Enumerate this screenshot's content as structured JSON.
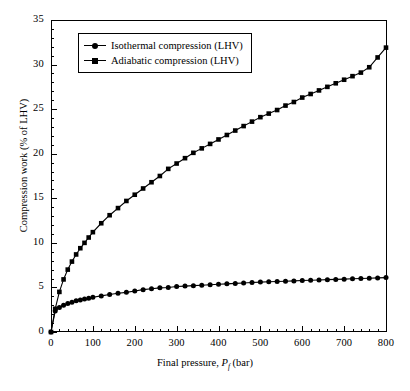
{
  "figure": {
    "background": "#ffffff",
    "foreground": "#000000"
  },
  "chart_data": {
    "type": "line",
    "title": "",
    "xlabel": "Final pressure, P_f (bar)",
    "ylabel": "Compression work (% of LHV)",
    "xlim": [
      0,
      800
    ],
    "ylim": [
      0,
      35
    ],
    "xticks": [
      0,
      100,
      200,
      300,
      400,
      500,
      600,
      700,
      800
    ],
    "yticks": [
      0,
      5,
      10,
      15,
      20,
      25,
      30,
      35
    ],
    "x_minor_interval": 20,
    "y_minor_interval": 1,
    "grid": false,
    "legend_position": "upper left",
    "x": [
      0,
      10,
      20,
      30,
      40,
      50,
      60,
      70,
      80,
      90,
      100,
      120,
      140,
      160,
      180,
      200,
      220,
      240,
      260,
      280,
      300,
      320,
      340,
      360,
      380,
      400,
      420,
      440,
      460,
      480,
      500,
      520,
      540,
      560,
      580,
      600,
      620,
      640,
      660,
      680,
      700,
      720,
      740,
      760,
      780,
      800
    ],
    "series": [
      {
        "name": "Isothermal compression (LHV)",
        "marker": "circle",
        "color": "#000000",
        "values": [
          0,
          2.35,
          2.75,
          3.0,
          3.2,
          3.35,
          3.5,
          3.6,
          3.7,
          3.8,
          3.9,
          4.05,
          4.2,
          4.35,
          4.45,
          4.6,
          4.75,
          4.85,
          4.95,
          5.0,
          5.1,
          5.15,
          5.2,
          5.25,
          5.3,
          5.35,
          5.4,
          5.45,
          5.5,
          5.55,
          5.6,
          5.63,
          5.67,
          5.7,
          5.73,
          5.77,
          5.8,
          5.83,
          5.87,
          5.9,
          5.93,
          5.97,
          6.0,
          6.03,
          6.07,
          6.1
        ]
      },
      {
        "name": "Adiabatic compression (LHV)",
        "marker": "square",
        "color": "#000000",
        "values": [
          0,
          2.6,
          4.5,
          5.9,
          7.0,
          7.9,
          8.7,
          9.4,
          10.0,
          10.6,
          11.2,
          12.2,
          13.1,
          13.9,
          14.7,
          15.4,
          16.1,
          16.8,
          17.5,
          18.3,
          18.9,
          19.5,
          20.1,
          20.6,
          21.1,
          21.6,
          22.1,
          22.6,
          23.1,
          23.6,
          24.1,
          24.5,
          24.9,
          25.4,
          25.8,
          26.3,
          26.7,
          27.1,
          27.5,
          27.9,
          28.3,
          28.7,
          29.1,
          29.7,
          30.8,
          31.9
        ]
      }
    ]
  },
  "legend": {
    "items": [
      {
        "label": "Isothermal compression (LHV)",
        "marker": "circle"
      },
      {
        "label": "Adiabatic compression (LHV)",
        "marker": "square"
      }
    ]
  },
  "axes": {
    "x_title_prefix": "Final pressure, ",
    "x_title_symbol": "P",
    "x_title_subscript": "f",
    "x_title_suffix": " (bar)",
    "y_title": "Compression work (% of LHV)",
    "x_tick_labels": [
      "0",
      "100",
      "200",
      "300",
      "400",
      "500",
      "600",
      "700",
      "800"
    ],
    "y_tick_labels": [
      "0",
      "5",
      "10",
      "15",
      "20",
      "25",
      "30",
      "35"
    ]
  }
}
